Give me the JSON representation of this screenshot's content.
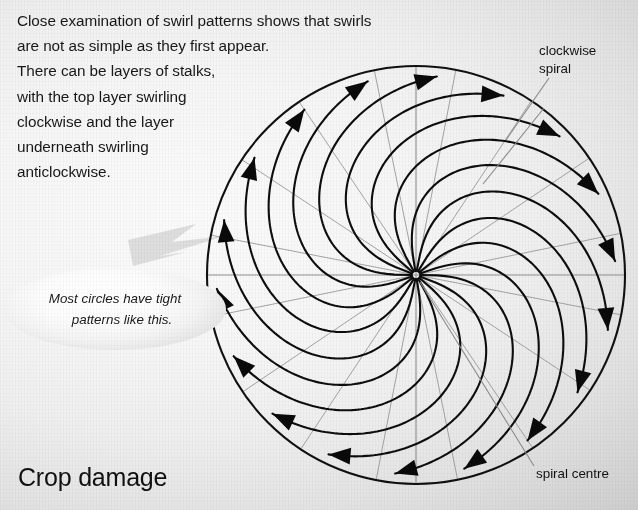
{
  "page": {
    "title": "Crop damage",
    "width": 638,
    "height": 510,
    "background_light": "#fbfbfb",
    "background_dark": "#c2c2c2"
  },
  "intro": {
    "lines": [
      "Close examination of swirl patterns shows that swirls",
      "are not as simple as they first appear.",
      "There can be layers of stalks,",
      "with the top layer swirling",
      "clockwise and the layer",
      "underneath swirling",
      "anticlockwise."
    ]
  },
  "callout": {
    "line1": "Most circles have tight",
    "line2": "patterns like this."
  },
  "annotations": [
    {
      "id": "clockwise-spiral",
      "line1": "clockwise",
      "line2": "spiral"
    },
    {
      "id": "spiral-centre",
      "line1": "spiral centre",
      "line2": ""
    }
  ],
  "chart_data": {
    "type": "polar-spiral-diagram",
    "title": "Crop damage",
    "circle": {
      "cx": 416,
      "cy": 275,
      "r": 209,
      "stroke": "#101010",
      "stroke_width": 2.1
    },
    "spiral_centre": {
      "x": 416,
      "y": 275,
      "label": "spiral centre"
    },
    "axes": {
      "show": true,
      "stroke": "#8e8e8e",
      "stroke_width": 1.1,
      "lines": [
        {
          "name": "horizontal-axis",
          "x1": 207,
          "y1": 275,
          "x2": 625,
          "y2": 275
        },
        {
          "name": "vertical-axis",
          "x1": 416,
          "y1": 66,
          "x2": 416,
          "y2": 484
        }
      ]
    },
    "radial_lines": {
      "count": 16,
      "stroke": "#9a9a9a",
      "stroke_width": 0.9,
      "start_angle_deg": 11,
      "note": "thin straight stalk lines from centre to perimeter, underlying layer"
    },
    "spiral_arms": {
      "count": 18,
      "direction": "clockwise",
      "stroke": "#0d0d0d",
      "stroke_width": 2.1,
      "turn_deg": 96,
      "tightness_b": 0.33,
      "inner_r_fraction": 0.02,
      "outer_r_fraction": 0.955,
      "arrowhead": {
        "length": 22,
        "half_width": 8.4,
        "fill": "#0a0a0a"
      }
    },
    "leaders": [
      {
        "name": "clockwise-spiral-leader",
        "x1": 549,
        "y1": 78,
        "x2": 506,
        "y2": 140,
        "stroke": "#8a8a8a"
      },
      {
        "name": "clockwise-spiral-leader-2",
        "x1": 544,
        "y1": 108,
        "x2": 483,
        "y2": 184,
        "stroke": "#8a8a8a"
      },
      {
        "name": "spiral-centre-leader",
        "x1": 534,
        "y1": 466,
        "x2": 420,
        "y2": 282,
        "stroke": "#8a8a8a"
      }
    ],
    "callout_pointer": {
      "name": "lightning-pointer",
      "fill": "#dcdcdc",
      "points": "128,240 196,224 172,242 225,236 160,256 186,252 133,266"
    }
  }
}
